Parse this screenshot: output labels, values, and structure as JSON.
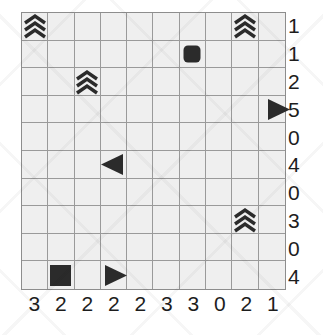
{
  "puzzle": {
    "grid": {
      "rows": 10,
      "cols": 10
    },
    "colors": {
      "cell_fill": "#efefef",
      "grid_line": "#9a9a9a",
      "grid_border": "#8d8d8d",
      "glyph": "#2b2b2b",
      "clue_text": "#1d1d1d",
      "page_background": "#ffffff"
    },
    "symbols": [
      {
        "row": 1,
        "col": 1,
        "kind": "chevron-stack-icon"
      },
      {
        "row": 1,
        "col": 9,
        "kind": "chevron-stack-icon"
      },
      {
        "row": 2,
        "col": 7,
        "kind": "rounded-square-icon"
      },
      {
        "row": 3,
        "col": 3,
        "kind": "chevron-stack-icon"
      },
      {
        "row": 4,
        "col": 10,
        "kind": "triangle-right-icon"
      },
      {
        "row": 6,
        "col": 4,
        "kind": "triangle-left-icon"
      },
      {
        "row": 8,
        "col": 9,
        "kind": "chevron-stack-icon"
      },
      {
        "row": 10,
        "col": 2,
        "kind": "filled-square-icon"
      },
      {
        "row": 10,
        "col": 4,
        "kind": "triangle-right-icon"
      }
    ],
    "right_clues": [
      "1",
      "1",
      "2",
      "5",
      "0",
      "4",
      "0",
      "3",
      "0",
      "4"
    ],
    "bottom_clues": [
      "3",
      "2",
      "2",
      "2",
      "2",
      "3",
      "3",
      "0",
      "2",
      "1"
    ]
  }
}
